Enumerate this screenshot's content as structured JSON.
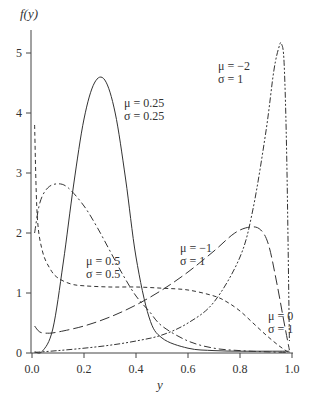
{
  "chart_data": {
    "type": "line",
    "title": "",
    "xlabel": "y",
    "ylabel": "f(y)",
    "xlim": [
      0,
      1
    ],
    "ylim": [
      0,
      5.3
    ],
    "grid": false,
    "legend": "inline annotations",
    "x_ticks": [
      "0.0",
      "0.2",
      "0.4",
      "0.6",
      "0.8",
      "1.0"
    ],
    "y_ticks": [
      "0",
      "1",
      "2",
      "3",
      "4",
      "5"
    ],
    "series": [
      {
        "name": "mu=0.25, sigma=0.25",
        "style": "solid",
        "label_mu": "μ = 0.25",
        "label_sigma": "σ = 0.25",
        "x": [
          0.01,
          0.04,
          0.08,
          0.12,
          0.16,
          0.2,
          0.24,
          0.28,
          0.32,
          0.36,
          0.4,
          0.45,
          0.5,
          0.6,
          0.7,
          0.8,
          0.9,
          0.99
        ],
        "y": [
          0.02,
          0.03,
          0.4,
          1.5,
          2.8,
          3.9,
          4.5,
          4.55,
          4.0,
          2.9,
          1.6,
          0.6,
          0.25,
          0.08,
          0.04,
          0.03,
          0.03,
          0.03
        ]
      },
      {
        "name": "mu=0.5, sigma=0.5",
        "style": "dashdot",
        "label_mu": "μ = 0.5",
        "label_sigma": "σ = 0.5",
        "x": [
          0.01,
          0.03,
          0.06,
          0.1,
          0.14,
          0.2,
          0.25,
          0.3,
          0.35,
          0.4,
          0.45,
          0.5,
          0.6,
          0.7,
          0.8,
          0.9,
          0.99
        ],
        "y": [
          2.0,
          2.5,
          2.75,
          2.82,
          2.75,
          2.45,
          2.1,
          1.7,
          1.3,
          0.95,
          0.7,
          0.45,
          0.2,
          0.08,
          0.04,
          0.02,
          0.01
        ]
      },
      {
        "name": "mu=0, sigma=1",
        "style": "dashed",
        "label_mu": "μ = 0",
        "label_sigma": "σ = 1",
        "x": [
          0.01,
          0.02,
          0.04,
          0.07,
          0.1,
          0.15,
          0.2,
          0.3,
          0.4,
          0.5,
          0.6,
          0.7,
          0.75,
          0.8,
          0.85,
          0.9,
          0.95,
          0.99
        ],
        "y": [
          3.8,
          2.3,
          1.7,
          1.4,
          1.25,
          1.15,
          1.12,
          1.1,
          1.1,
          1.08,
          1.05,
          0.95,
          0.85,
          0.7,
          0.5,
          0.3,
          0.12,
          0.0
        ]
      },
      {
        "name": "mu=-1, sigma=1",
        "style": "long-dash",
        "label_mu": "μ = −1",
        "label_sigma": "σ = 1",
        "x": [
          0.01,
          0.03,
          0.06,
          0.1,
          0.2,
          0.3,
          0.4,
          0.5,
          0.6,
          0.7,
          0.78,
          0.84,
          0.88,
          0.91,
          0.94,
          0.97,
          0.99
        ],
        "y": [
          0.45,
          0.35,
          0.33,
          0.35,
          0.45,
          0.6,
          0.8,
          1.05,
          1.35,
          1.7,
          2.0,
          2.1,
          2.05,
          1.8,
          1.2,
          0.5,
          0.05
        ]
      },
      {
        "name": "mu=-2, sigma=1",
        "style": "dash-dot-dot",
        "label_mu": "μ = −2",
        "label_sigma": "σ = 1",
        "x": [
          0.01,
          0.1,
          0.2,
          0.3,
          0.4,
          0.5,
          0.6,
          0.7,
          0.8,
          0.85,
          0.9,
          0.93,
          0.95,
          0.96,
          0.97,
          0.98,
          0.99
        ],
        "y": [
          0.01,
          0.04,
          0.08,
          0.13,
          0.2,
          0.3,
          0.5,
          0.85,
          1.6,
          2.4,
          3.7,
          4.7,
          5.1,
          5.15,
          4.8,
          3.2,
          0.2
        ]
      }
    ]
  }
}
